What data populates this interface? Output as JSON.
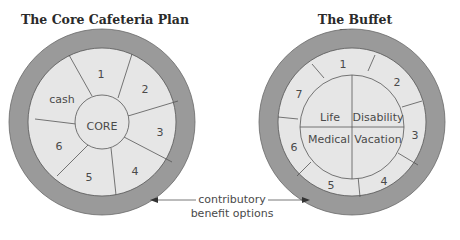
{
  "diagrams": [
    {
      "title": "The Core Cafeteria Plan",
      "core_label": "CORE",
      "segments": [
        "1",
        "2",
        "3",
        "4",
        "5",
        "6",
        "cash"
      ]
    },
    {
      "title": "The Buffet Plan",
      "core_quadrants": [
        "Life",
        "Disability",
        "Medical",
        "Vacation"
      ],
      "segments": [
        "1",
        "2",
        "3",
        "4",
        "5",
        "6",
        "7"
      ]
    }
  ],
  "annotation": {
    "line1": "contributory",
    "line2": "benefit options"
  },
  "colors": {
    "outer_ring": "#9a9a9a",
    "segment_fill": "#e6e6e6",
    "stroke": "#555555"
  }
}
